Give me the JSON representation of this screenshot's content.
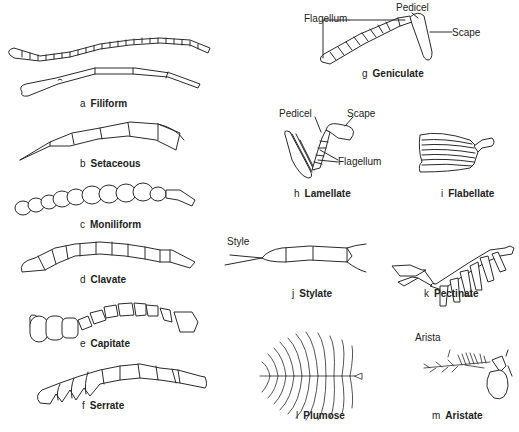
{
  "figure": {
    "background": "#ffffff",
    "line_color": "#2a2a2a"
  },
  "panels": [
    {
      "id": "a",
      "letter": "a",
      "name": "Filiform"
    },
    {
      "id": "b",
      "letter": "b",
      "name": "Setaceous"
    },
    {
      "id": "c",
      "letter": "c",
      "name": "Moniliform"
    },
    {
      "id": "d",
      "letter": "d",
      "name": "Clavate"
    },
    {
      "id": "e",
      "letter": "e",
      "name": "Capitate"
    },
    {
      "id": "f",
      "letter": "f",
      "name": "Serrate"
    },
    {
      "id": "g",
      "letter": "g",
      "name": "Geniculate"
    },
    {
      "id": "h",
      "letter": "h",
      "name": "Lamellate"
    },
    {
      "id": "i",
      "letter": "i",
      "name": "Flabellate"
    },
    {
      "id": "j",
      "letter": "j",
      "name": "Stylate"
    },
    {
      "id": "k",
      "letter": "k",
      "name": "Pectinate"
    },
    {
      "id": "l",
      "letter": "l",
      "name": "Plumose"
    },
    {
      "id": "m",
      "letter": "m",
      "name": "Aristate"
    }
  ],
  "annotations": {
    "geniculate": {
      "pedicel": "Pedicel",
      "flagellum": "Flagellum",
      "scape": "Scape"
    },
    "lamellate": {
      "pedicel": "Pedicel",
      "scape": "Scape",
      "flagellum": "Flagellum"
    },
    "stylate": {
      "style": "Style"
    },
    "aristate": {
      "arista": "Arista"
    }
  }
}
